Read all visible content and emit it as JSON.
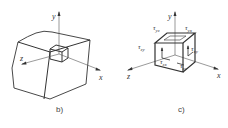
{
  "figure_b": {
    "caption": "b)",
    "axes": {
      "x": "x",
      "y": "y",
      "z": "z"
    }
  },
  "figure_c": {
    "caption": "c)",
    "axes": {
      "x": "x",
      "y": "y",
      "z": "z"
    },
    "stress_labels": {
      "tau_yz": "τyz",
      "tau_yx": "τyx",
      "tau_zy": "τzy",
      "tau_xy": "τxy",
      "tau_zx": "τzx",
      "tau_xz": "τxz"
    },
    "stress_sub": {
      "tau_yz": "yz",
      "tau_yx": "yx",
      "tau_zy": "zy",
      "tau_xy": "xy",
      "tau_zx": "zx",
      "tau_xz": "xz"
    }
  },
  "colors": {
    "line": "#333333",
    "thin": "#666666",
    "background": "#ffffff"
  }
}
